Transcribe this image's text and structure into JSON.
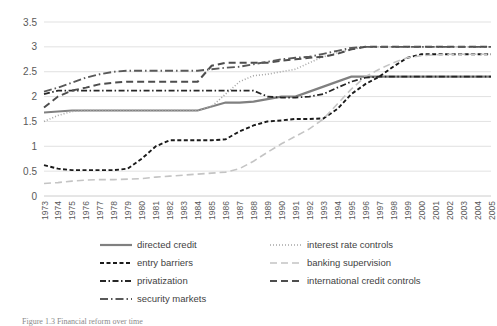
{
  "chart_data": {
    "type": "line",
    "title": "",
    "xlabel": "",
    "ylabel": "",
    "ylim": [
      0,
      3.5
    ],
    "ytick_labels": [
      "0",
      "0.5",
      "1",
      "1.5",
      "2",
      "2.5",
      "3",
      "3.5"
    ],
    "ytick_values": [
      0,
      0.5,
      1,
      1.5,
      2,
      2.5,
      3,
      3.5
    ],
    "grid": true,
    "legend_position": "bottom",
    "x": [
      1973,
      1974,
      1975,
      1976,
      1977,
      1978,
      1979,
      1980,
      1981,
      1982,
      1983,
      1984,
      1985,
      1986,
      1987,
      1988,
      1989,
      1990,
      1991,
      1992,
      1993,
      1994,
      1995,
      1996,
      1997,
      1998,
      1999,
      2000,
      2001,
      2002,
      2003,
      2004,
      2005
    ],
    "categories": [
      "1973",
      "1974",
      "1975",
      "1976",
      "1977",
      "1978",
      "1979",
      "1980",
      "1981",
      "1982",
      "1983",
      "1984",
      "1985",
      "1986",
      "1987",
      "1988",
      "1989",
      "1990",
      "1991",
      "1992",
      "1993",
      "1994",
      "1995",
      "1996",
      "1997",
      "1998",
      "1999",
      "2000",
      "2001",
      "2002",
      "2003",
      "2004",
      "2005"
    ],
    "series": [
      {
        "name": "directed credit",
        "color": "#808080",
        "dash": "none",
        "width": 2.2,
        "values": [
          1.68,
          1.7,
          1.72,
          1.72,
          1.72,
          1.72,
          1.72,
          1.72,
          1.72,
          1.72,
          1.72,
          1.72,
          1.8,
          1.88,
          1.88,
          1.9,
          1.95,
          2.0,
          2.0,
          2.1,
          2.2,
          2.3,
          2.4,
          2.4,
          2.4,
          2.4,
          2.4,
          2.4,
          2.4,
          2.4,
          2.4,
          2.4,
          2.4
        ]
      },
      {
        "name": "interest rate controls",
        "color": "#a6a6a6",
        "dash": "dotted",
        "width": 1.6,
        "values": [
          1.5,
          1.62,
          1.7,
          1.72,
          1.72,
          1.72,
          1.72,
          1.72,
          1.72,
          1.72,
          1.72,
          1.72,
          1.8,
          2.05,
          2.3,
          2.42,
          2.45,
          2.5,
          2.55,
          2.68,
          2.8,
          2.88,
          2.95,
          3.0,
          3.0,
          3.0,
          3.0,
          3.0,
          3.0,
          3.0,
          3.0,
          3.0,
          3.0
        ]
      },
      {
        "name": "entry barriers",
        "color": "#1a1a1a",
        "dash": "dashed",
        "width": 1.9,
        "values": [
          0.62,
          0.55,
          0.52,
          0.52,
          0.52,
          0.52,
          0.55,
          0.75,
          1.0,
          1.12,
          1.12,
          1.12,
          1.12,
          1.14,
          1.3,
          1.42,
          1.5,
          1.52,
          1.55,
          1.55,
          1.56,
          1.75,
          2.05,
          2.25,
          2.4,
          2.6,
          2.78,
          2.85,
          2.85,
          2.85,
          2.85,
          2.85,
          2.85
        ]
      },
      {
        "name": "banking supervision",
        "color": "#c4c4c4",
        "dash": "longdash",
        "width": 1.6,
        "values": [
          0.25,
          0.27,
          0.3,
          0.32,
          0.33,
          0.33,
          0.34,
          0.35,
          0.38,
          0.4,
          0.42,
          0.44,
          0.46,
          0.48,
          0.55,
          0.7,
          0.88,
          1.05,
          1.2,
          1.35,
          1.55,
          1.85,
          2.15,
          2.4,
          2.55,
          2.68,
          2.78,
          2.82,
          2.84,
          2.85,
          2.85,
          2.85,
          2.85
        ]
      },
      {
        "name": "privatization",
        "color": "#262626",
        "dash": "dashdot",
        "width": 1.8,
        "values": [
          2.05,
          2.12,
          2.12,
          2.12,
          2.12,
          2.12,
          2.12,
          2.12,
          2.12,
          2.12,
          2.12,
          2.12,
          2.12,
          2.12,
          2.12,
          2.12,
          2.0,
          1.98,
          1.98,
          2.0,
          2.05,
          2.18,
          2.3,
          2.38,
          2.4,
          2.4,
          2.4,
          2.4,
          2.4,
          2.4,
          2.4,
          2.4,
          2.4
        ]
      },
      {
        "name": "international credit controls",
        "color": "#4d4d4d",
        "dash": "longdash",
        "width": 2.0,
        "values": [
          1.78,
          2.0,
          2.12,
          2.18,
          2.25,
          2.28,
          2.3,
          2.3,
          2.3,
          2.3,
          2.3,
          2.3,
          2.62,
          2.68,
          2.68,
          2.68,
          2.68,
          2.72,
          2.75,
          2.78,
          2.8,
          2.86,
          2.95,
          3.0,
          3.0,
          3.0,
          3.0,
          3.0,
          3.0,
          3.0,
          3.0,
          3.0,
          3.0
        ]
      },
      {
        "name": "security markets",
        "color": "#595959",
        "dash": "dashdotlong",
        "width": 1.9,
        "values": [
          2.1,
          2.18,
          2.28,
          2.38,
          2.45,
          2.5,
          2.52,
          2.52,
          2.52,
          2.52,
          2.52,
          2.52,
          2.55,
          2.58,
          2.6,
          2.65,
          2.7,
          2.75,
          2.78,
          2.8,
          2.86,
          2.92,
          2.98,
          3.0,
          3.0,
          3.0,
          3.0,
          3.0,
          3.0,
          3.0,
          3.0,
          3.0,
          3.0
        ]
      }
    ]
  },
  "legend": {
    "entries": [
      {
        "label": "directed credit"
      },
      {
        "label": "interest rate controls"
      },
      {
        "label": "entry barriers"
      },
      {
        "label": "banking supervision"
      },
      {
        "label": "privatization"
      },
      {
        "label": "international credit controls"
      },
      {
        "label": "security markets"
      }
    ],
    "order": [
      0,
      1,
      2,
      3,
      4,
      5,
      6
    ]
  },
  "caption": {
    "text": "Figure 1.3  Financial reform over time"
  }
}
